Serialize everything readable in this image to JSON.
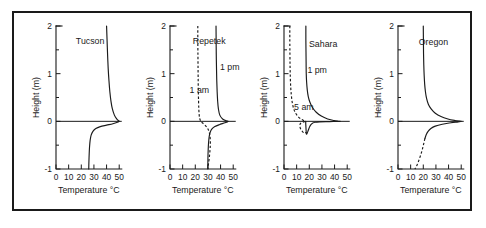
{
  "figure": {
    "panel_count": 4,
    "shared_xlabel": "Temperature °C",
    "shared_ylabel": "Height (m)",
    "xticks": [
      "0",
      "10",
      "20",
      "30",
      "40",
      "50"
    ],
    "yticks": [
      "2",
      "1",
      "0",
      "-1"
    ],
    "line_color": "#1a1a1a",
    "border_color": "#1a1a1a",
    "background": "#ffffff"
  },
  "chart_data": {
    "type": "line",
    "title": "",
    "xlabel": "Temperature °C",
    "ylabel": "Height (m)",
    "xlim": [
      0,
      53
    ],
    "ylim": [
      -1,
      2
    ],
    "xticks": [
      0,
      10,
      20,
      30,
      40,
      50
    ],
    "yticks": [
      2,
      1,
      0,
      -1
    ],
    "minor_yticks": [
      1.5,
      0.5,
      -0.5
    ],
    "grid": false,
    "legend": "inline-annotations",
    "panels": [
      {
        "name": "Tucson",
        "label": "Tucson",
        "label_pos": [
          27,
          1.62
        ],
        "series": [
          {
            "name": "profile",
            "style": "solid",
            "annotation": "",
            "points": [
              [
                40.0,
                2.0
              ],
              [
                40.4,
                1.7
              ],
              [
                40.8,
                1.4
              ],
              [
                41.3,
                1.1
              ],
              [
                41.9,
                0.85
              ],
              [
                42.6,
                0.62
              ],
              [
                43.5,
                0.42
              ],
              [
                44.6,
                0.26
              ],
              [
                46.2,
                0.13
              ],
              [
                48.0,
                0.05
              ],
              [
                49.6,
                0.01
              ],
              [
                50.0,
                0.0
              ],
              [
                48.6,
                -0.02
              ],
              [
                45.0,
                -0.05
              ],
              [
                40.0,
                -0.08
              ],
              [
                35.0,
                -0.11
              ],
              [
                31.5,
                -0.15
              ],
              [
                29.2,
                -0.21
              ],
              [
                27.8,
                -0.29
              ],
              [
                27.0,
                -0.4
              ],
              [
                26.5,
                -0.55
              ],
              [
                26.2,
                -0.72
              ],
              [
                26.0,
                -0.88
              ],
              [
                25.9,
                -1.0
              ]
            ]
          }
        ]
      },
      {
        "name": "Repetek",
        "label": "Repetek",
        "label_pos": [
          31,
          1.62
        ],
        "series": [
          {
            "name": "1 pm",
            "style": "solid",
            "annotation": "1 pm",
            "annotation_pos": [
              39.5,
              1.08
            ],
            "points": [
              [
                36.4,
                2.0
              ],
              [
                36.5,
                1.7
              ],
              [
                36.6,
                1.4
              ],
              [
                36.8,
                1.1
              ],
              [
                37.0,
                0.85
              ],
              [
                37.3,
                0.62
              ],
              [
                37.7,
                0.42
              ],
              [
                38.3,
                0.26
              ],
              [
                39.4,
                0.13
              ],
              [
                41.6,
                0.05
              ],
              [
                44.6,
                0.01
              ],
              [
                46.0,
                0.0
              ],
              [
                43.5,
                -0.03
              ],
              [
                39.0,
                -0.07
              ],
              [
                35.5,
                -0.11
              ],
              [
                33.2,
                -0.16
              ],
              [
                31.8,
                -0.23
              ],
              [
                31.0,
                -0.32
              ],
              [
                30.5,
                -0.45
              ],
              [
                30.2,
                -0.6
              ],
              [
                30.0,
                -0.78
              ],
              [
                29.9,
                -1.0
              ]
            ]
          },
          {
            "name": "1 am",
            "style": "dashed",
            "annotation": "1 am",
            "annotation_pos": [
              15.5,
              0.6
            ],
            "points": [
              [
                22.0,
                2.0
              ],
              [
                22.0,
                1.7
              ],
              [
                22.1,
                1.4
              ],
              [
                22.2,
                1.1
              ],
              [
                22.3,
                0.85
              ],
              [
                22.4,
                0.62
              ],
              [
                22.6,
                0.42
              ],
              [
                22.8,
                0.26
              ],
              [
                23.1,
                0.13
              ],
              [
                23.6,
                0.05
              ],
              [
                24.2,
                0.01
              ],
              [
                24.6,
                0.0
              ],
              [
                25.6,
                -0.03
              ],
              [
                27.3,
                -0.07
              ],
              [
                29.0,
                -0.12
              ],
              [
                30.4,
                -0.18
              ],
              [
                31.3,
                -0.26
              ],
              [
                31.8,
                -0.36
              ],
              [
                31.9,
                -0.48
              ],
              [
                31.6,
                -0.62
              ],
              [
                31.0,
                -0.78
              ],
              [
                30.4,
                -0.9
              ],
              [
                29.9,
                -1.0
              ]
            ]
          }
        ]
      },
      {
        "name": "Sahara",
        "label": "Sahara",
        "label_pos": [
          31,
          1.55
        ],
        "series": [
          {
            "name": "1 pm",
            "style": "solid",
            "annotation": "1 pm",
            "annotation_pos": [
              18.5,
              1.02
            ],
            "points": [
              [
                17.3,
                2.0
              ],
              [
                17.3,
                1.7
              ],
              [
                17.4,
                1.45
              ],
              [
                17.5,
                1.2
              ],
              [
                17.6,
                1.0
              ],
              [
                17.9,
                0.82
              ],
              [
                18.4,
                0.66
              ],
              [
                19.2,
                0.52
              ],
              [
                20.5,
                0.4
              ],
              [
                22.5,
                0.29
              ],
              [
                25.5,
                0.19
              ],
              [
                29.5,
                0.11
              ],
              [
                34.5,
                0.05
              ],
              [
                39.5,
                0.018
              ],
              [
                43.0,
                0.002
              ],
              [
                44.0,
                0.0
              ],
              [
                36.0,
                -0.005
              ],
              [
                28.0,
                -0.01
              ],
              [
                24.5,
                -0.02
              ],
              [
                22.5,
                -0.04
              ],
              [
                21.3,
                -0.07
              ],
              [
                20.4,
                -0.11
              ],
              [
                19.6,
                -0.16
              ],
              [
                18.9,
                -0.21
              ],
              [
                18.3,
                -0.25
              ],
              [
                17.9,
                -0.27
              ],
              [
                17.7,
                -0.265
              ],
              [
                17.6,
                -0.24
              ],
              [
                17.5,
                -0.2
              ],
              [
                17.4,
                -0.15
              ],
              [
                17.3,
                -0.1
              ],
              [
                17.2,
                -0.05
              ],
              [
                17.2,
                -0.02
              ],
              [
                17.2,
                0.0
              ]
            ]
          },
          {
            "name": "5 am",
            "style": "dashed",
            "annotation": "5 am",
            "annotation_pos": [
              8.0,
              0.24
            ],
            "points": [
              [
                4.6,
                2.0
              ],
              [
                4.6,
                1.7
              ],
              [
                4.7,
                1.4
              ],
              [
                4.8,
                1.15
              ],
              [
                5.0,
                0.92
              ],
              [
                5.3,
                0.72
              ],
              [
                5.8,
                0.55
              ],
              [
                6.5,
                0.4
              ],
              [
                7.6,
                0.27
              ],
              [
                9.2,
                0.17
              ],
              [
                11.5,
                0.09
              ],
              [
                14.0,
                0.04
              ],
              [
                16.0,
                0.01
              ],
              [
                17.0,
                0.0
              ],
              [
                16.0,
                -0.01
              ],
              [
                14.5,
                -0.02
              ],
              [
                13.2,
                -0.04
              ],
              [
                12.6,
                -0.07
              ],
              [
                12.6,
                -0.11
              ],
              [
                13.0,
                -0.15
              ],
              [
                13.8,
                -0.19
              ],
              [
                14.8,
                -0.22
              ],
              [
                15.7,
                -0.24
              ],
              [
                16.4,
                -0.25
              ],
              [
                16.9,
                -0.245
              ],
              [
                17.1,
                -0.23
              ]
            ]
          }
        ]
      },
      {
        "name": "Oregon",
        "label": "Oregon",
        "label_pos": [
          28,
          1.6
        ],
        "series": [
          {
            "name": "above-ground",
            "style": "solid",
            "annotation": "",
            "points": [
              [
                20.0,
                2.0
              ],
              [
                20.1,
                1.7
              ],
              [
                20.2,
                1.42
              ],
              [
                20.4,
                1.18
              ],
              [
                20.7,
                0.96
              ],
              [
                21.1,
                0.78
              ],
              [
                21.7,
                0.62
              ],
              [
                22.6,
                0.48
              ],
              [
                24.0,
                0.36
              ],
              [
                26.2,
                0.26
              ],
              [
                29.5,
                0.17
              ],
              [
                34.0,
                0.1
              ],
              [
                39.5,
                0.05
              ],
              [
                45.0,
                0.018
              ],
              [
                48.8,
                0.003
              ],
              [
                50.0,
                0.0
              ],
              [
                47.5,
                -0.01
              ],
              [
                42.0,
                -0.03
              ],
              [
                35.0,
                -0.06
              ],
              [
                29.5,
                -0.1
              ],
              [
                26.0,
                -0.15
              ],
              [
                23.8,
                -0.21
              ],
              [
                22.3,
                -0.28
              ],
              [
                21.3,
                -0.36
              ]
            ]
          },
          {
            "name": "below-ground",
            "style": "dashed",
            "annotation": "",
            "points": [
              [
                21.3,
                -0.36
              ],
              [
                20.5,
                -0.45
              ],
              [
                19.6,
                -0.55
              ],
              [
                18.6,
                -0.65
              ],
              [
                17.4,
                -0.75
              ],
              [
                16.2,
                -0.84
              ],
              [
                15.0,
                -0.92
              ],
              [
                13.9,
                -0.98
              ],
              [
                13.3,
                -1.0
              ]
            ]
          }
        ]
      }
    ]
  }
}
